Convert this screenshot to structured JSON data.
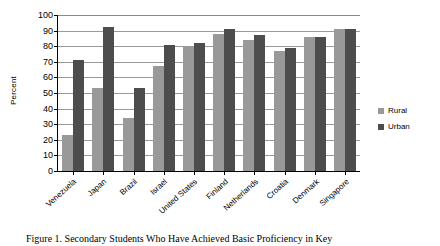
{
  "chart_data": {
    "type": "bar",
    "title": "",
    "xlabel": "",
    "ylabel": "Percent",
    "ylim": [
      0,
      100
    ],
    "ytick_step": 10,
    "grid": true,
    "legend_position": "right",
    "categories": [
      "Venezuela",
      "Japan",
      "Brazil",
      "Israel",
      "United States",
      "Finland",
      "Netherlands",
      "Croatia",
      "Denmark",
      "Singapore"
    ],
    "ytick_labels": [
      "0",
      "10",
      "20",
      "30",
      "40",
      "50",
      "60",
      "70",
      "80",
      "90",
      "100"
    ],
    "series": [
      {
        "name": "Rural",
        "color": "#999999",
        "values": [
          23,
          53,
          34,
          67,
          80,
          88,
          84,
          77,
          86,
          91
        ]
      },
      {
        "name": "Urban",
        "color": "#4d4d4d",
        "values": [
          71,
          92,
          53,
          81,
          82,
          91,
          87,
          79,
          86,
          91
        ]
      }
    ]
  },
  "caption": {
    "text": "Figure 1. Secondary Students Who Have Achieved Basic Proficiency in Key"
  }
}
